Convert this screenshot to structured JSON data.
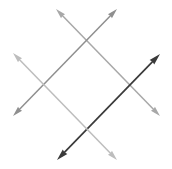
{
  "figure": {
    "title": "",
    "type": "line-diagram",
    "width": 172,
    "height": 169,
    "background_color": "#ffffff",
    "arrows": [
      {
        "id": "arrow-light-gray-nwse",
        "name": "arrow-upper-left-to-lower-right",
        "color": "#a8a8a8",
        "stroke_width": 1.5,
        "head_size": 7,
        "double_headed": true,
        "start_x": 56,
        "start_y": 9,
        "end_x": 160,
        "end_y": 116,
        "direction": "northwest-southeast"
      },
      {
        "id": "arrow-medium-gray-nesw",
        "name": "arrow-upper-right-to-lower-left",
        "color": "#8f8f8f",
        "stroke_width": 1.5,
        "head_size": 7,
        "double_headed": true,
        "start_x": 117,
        "start_y": 9,
        "end_x": 13,
        "end_y": 116,
        "direction": "northeast-southwest"
      },
      {
        "id": "arrow-dark-swne",
        "name": "arrow-lower-left-to-upper-right",
        "color": "#3a3a3a",
        "stroke_width": 1.7,
        "head_size": 8,
        "double_headed": true,
        "start_x": 57,
        "start_y": 160,
        "end_x": 160,
        "end_y": 54,
        "direction": "southwest-northeast"
      },
      {
        "id": "arrow-pale-nwse-left",
        "name": "arrow-left-to-lower-right",
        "color": "#bdbdbd",
        "stroke_width": 1.5,
        "head_size": 7,
        "double_headed": true,
        "start_x": 13,
        "start_y": 53,
        "end_x": 117,
        "end_y": 160,
        "direction": "northwest-southeast"
      }
    ],
    "intersections": [
      {
        "name": "top-vertex",
        "x": 88,
        "y": 41
      },
      {
        "name": "left-vertex",
        "x": 41,
        "y": 85
      },
      {
        "name": "right-vertex",
        "x": 133,
        "y": 85
      },
      {
        "name": "bottom-vertex",
        "x": 88,
        "y": 128
      }
    ]
  }
}
